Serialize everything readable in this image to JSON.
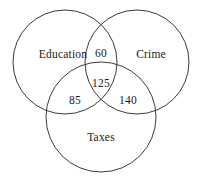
{
  "figure": {
    "kind": "venn-diagram",
    "background_color": "#ffffff",
    "stroke_color": "#3b3b3b",
    "text_color": "#1b1b1b"
  },
  "sets": [
    {
      "id": "education",
      "label": "Education",
      "label_x": 63,
      "label_y": 55,
      "circle": {
        "cx": 65,
        "cy": 62,
        "r": 52
      }
    },
    {
      "id": "crime",
      "label": "Crime",
      "label_x": 151,
      "label_y": 55,
      "circle": {
        "cx": 137,
        "cy": 62,
        "r": 52
      }
    },
    {
      "id": "taxes",
      "label": "Taxes",
      "label_x": 101,
      "label_y": 138,
      "circle": {
        "cx": 101,
        "cy": 117,
        "r": 55
      }
    }
  ],
  "regions": [
    {
      "id": "education-crime",
      "value": "60",
      "label_x": 101,
      "label_y": 54
    },
    {
      "id": "education-crime-taxes",
      "value": "125",
      "label_x": 101,
      "label_y": 84
    },
    {
      "id": "education-taxes",
      "value": "85",
      "label_x": 75,
      "label_y": 101
    },
    {
      "id": "crime-taxes",
      "value": "140",
      "label_x": 128,
      "label_y": 101
    }
  ],
  "chart_data": {
    "type": "venn",
    "title": "",
    "sets": [
      "Education",
      "Crime",
      "Taxes"
    ],
    "region_values": {
      "Education∩Crime": 60,
      "Education∩Crime∩Taxes": 125,
      "Education∩Taxes": 85,
      "Crime∩Taxes": 140,
      "Education only": null,
      "Crime only": null,
      "Taxes only": null
    },
    "labels_shown": [
      "Education",
      "Crime",
      "Taxes",
      "60",
      "125",
      "85",
      "140"
    ],
    "grid": false,
    "legend": "none"
  }
}
